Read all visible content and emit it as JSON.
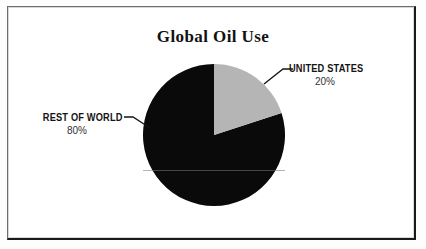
{
  "chart_data": {
    "type": "pie",
    "title": "Global Oil Use",
    "categories": [
      "UNITED STATES",
      "REST OF WORLD"
    ],
    "values": [
      20,
      80
    ],
    "value_labels": [
      "20%",
      "80%"
    ],
    "colors": [
      "#b5b5b5",
      "#0a0a0a"
    ],
    "start_angle_deg": 0,
    "direction": "clockwise",
    "legend": "callout-labels",
    "grid": false,
    "xlabel": "",
    "ylabel": ""
  },
  "figure": {
    "title": "Global Oil Use",
    "frame_color": "#1a1a1a",
    "background": "#ffffff"
  },
  "slices": [
    {
      "name": "UNITED STATES",
      "percent_label": "20%",
      "value": 20,
      "color": "#b5b5b5"
    },
    {
      "name": "REST OF WORLD",
      "percent_label": "80%",
      "value": 80,
      "color": "#0a0a0a"
    }
  ]
}
